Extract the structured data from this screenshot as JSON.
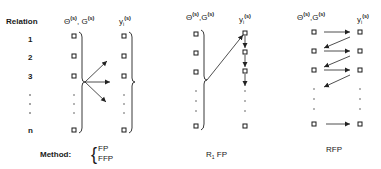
{
  "row_labels": {
    "header": "Relation",
    "rows": [
      "1",
      "2",
      "3",
      "n"
    ]
  },
  "panels": [
    {
      "name": "fp-ffp",
      "left_header": {
        "main1": "Θ",
        "sup1": "(s)",
        "sep": ", ",
        "main2": "G",
        "sup2": "(s)"
      },
      "right_header": {
        "main": "y",
        "sub": "i",
        "sup": "(s)"
      },
      "caption_prefix": "Method:",
      "caption_options": [
        "FP",
        "FFP"
      ]
    },
    {
      "name": "r1fp",
      "left_header": {
        "main1": "Θ",
        "sup1": "(s)",
        "sep": ",",
        "main2": "G",
        "sup2": "(s)"
      },
      "right_header": {
        "main": "y",
        "sub": "i",
        "sup": "(s)"
      },
      "caption_main": "R",
      "caption_sub": "1",
      "caption_rest": " FP"
    },
    {
      "name": "rfp",
      "left_header": {
        "main1": "Θ",
        "sup1": "(s)",
        "sep": ",",
        "main2": "G",
        "sup2": "(s)"
      },
      "right_header": {
        "main": "y",
        "sub": "i",
        "sup": "(s)"
      },
      "caption": "RFP"
    }
  ],
  "brace_open": "{"
}
